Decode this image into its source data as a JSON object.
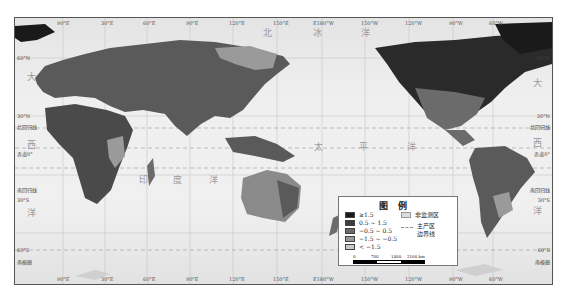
{
  "map": {
    "title": "World map of production regions (Pacific-centered)",
    "top_ticks": [
      "90°E",
      "30°E",
      "60°E",
      "90°E",
      "120°E",
      "150°E",
      "E180°W",
      "150°W",
      "120°W",
      "90°W",
      "60°W"
    ],
    "bottom_ticks": [
      "90°E",
      "30°E",
      "60°E",
      "90°E",
      "120°E",
      "150°E",
      "E180°W",
      "150°W",
      "120°W",
      "90°W",
      "60°W"
    ],
    "left_lat_labels": [
      "60°N",
      "30°N",
      "北回归线",
      "赤道0°",
      "南回归线",
      "30°S",
      "60°S",
      "南极圈"
    ],
    "right_lat_labels": [
      "60°N",
      "30°N",
      "北回归线",
      "赤道0°",
      "南回归线",
      "30°S",
      "60°S",
      "南极圈"
    ],
    "ocean_labels": {
      "arctic": [
        "北",
        "冰",
        "洋"
      ],
      "atlantic_left": [
        "大",
        "西",
        "洋"
      ],
      "indian": [
        "印",
        "度",
        "洋"
      ],
      "pacific": [
        "太",
        "平",
        "洋"
      ],
      "atlantic_right": [
        "大",
        "西",
        "洋"
      ]
    },
    "colors": {
      "ocean": "#ececec",
      "class_ge_1_5": "#1a1a1a",
      "class_0_5_1_5": "#3d3d3d",
      "class_m0_5_0_5": "#6b6b6b",
      "class_m1_5_m0_5": "#9a9a9a",
      "class_lt_m1_5": "#c8c8c8",
      "non_monitored": "#dcdcdc"
    }
  },
  "legend": {
    "title": "图例",
    "classes": [
      {
        "label": "≥1.5",
        "color": "#1a1a1a"
      },
      {
        "label": "0.5 ~ 1.5",
        "color": "#3d3d3d"
      },
      {
        "label": "−0.5 ~ 0.5",
        "color": "#6b6b6b"
      },
      {
        "label": "−1.5 ~ −0.5",
        "color": "#9a9a9a"
      },
      {
        "label": "< −1.5",
        "color": "#c8c8c8"
      }
    ],
    "non_monitored_label": "非监测区",
    "boundary_label_line1": "主产区",
    "boundary_label_line2": "边界线",
    "scale": {
      "labels": [
        "0",
        "700",
        "1400",
        "2100 km"
      ]
    }
  }
}
